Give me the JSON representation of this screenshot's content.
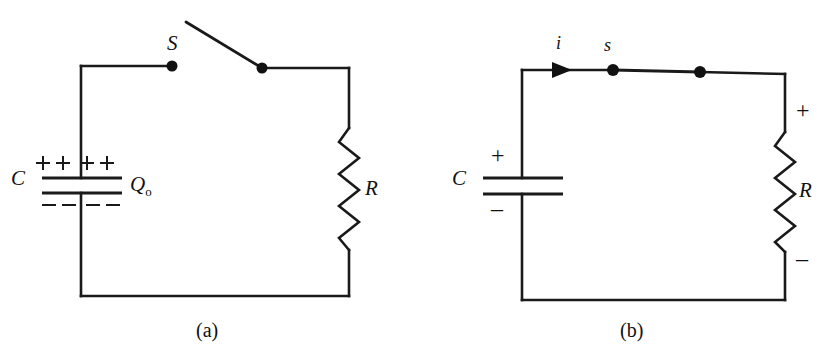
{
  "figure": {
    "background_color": "#ffffff",
    "ink_color": "#1a1a1a"
  },
  "panels": [
    {
      "id": "panel-a",
      "caption": "(a)",
      "description": "Capacitor C charged to Q-sub-0 with switch S open, in series with resistor R",
      "labels": {
        "capacitor": "C",
        "charge": "Q",
        "charge_subscript": "o",
        "switch": "S",
        "resistor": "R"
      },
      "charges": {
        "top_row": "+ + + +",
        "bottom_row": "– – – –",
        "top_count": 4,
        "bottom_count": 4
      },
      "switch_state": "open"
    },
    {
      "id": "panel-b",
      "caption": "(b)",
      "description": "Switch s closed; current i flows from capacitor C through resistor R",
      "labels": {
        "capacitor": "C",
        "switch": "s",
        "current": "i",
        "resistor": "R"
      },
      "polarity": {
        "capacitor_top": "+",
        "capacitor_bottom": "–",
        "resistor_top": "+",
        "resistor_bottom": "–"
      },
      "switch_state": "closed",
      "current_direction": "clockwise-right"
    }
  ]
}
